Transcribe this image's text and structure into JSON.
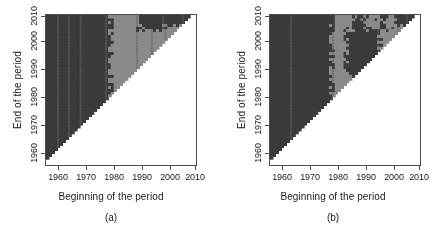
{
  "figure": {
    "width": 444,
    "height": 233,
    "background": "#ffffff",
    "colors": {
      "dark": "#3a3a3a",
      "light": "#8a8a8a",
      "empty": "#ffffff",
      "frame": "#4d4d4d",
      "text": "#1a1a1a"
    }
  },
  "panels": [
    {
      "key": "a",
      "sublabel": "(a)",
      "xlabel": "Beginning of the period",
      "ylabel": "End of the period",
      "xticks": [
        "1960",
        "1970",
        "1980",
        "1990",
        "2000",
        "2010"
      ],
      "yticks": [
        "1960",
        "1970",
        "1980",
        "1990",
        "2000",
        "2010"
      ]
    },
    {
      "key": "b",
      "sublabel": "(b)",
      "xlabel": "Beginning of the period",
      "ylabel": "End of the period",
      "xticks": [
        "1960",
        "1970",
        "1980",
        "1990",
        "2000",
        "2010"
      ],
      "yticks": [
        "1960",
        "1970",
        "1980",
        "1990",
        "2000",
        "2010"
      ]
    }
  ],
  "chart_data": [
    {
      "type": "heatmap",
      "panel": "a",
      "title": "",
      "xlabel": "Beginning of the period",
      "ylabel": "End of the period",
      "xlim": [
        1958,
        2011
      ],
      "ylim": [
        1958,
        2011
      ],
      "xticks": [
        1960,
        1970,
        1980,
        1990,
        2000,
        2010
      ],
      "yticks": [
        1960,
        1970,
        1980,
        1990,
        2000,
        2010
      ],
      "grid": false,
      "legend": "none",
      "categories_z": [
        "dark",
        "light",
        "empty"
      ],
      "z_colors": {
        "dark": "#3a3a3a",
        "light": "#8a8a8a",
        "empty": "#ffffff"
      },
      "note": "Lower-right triangle (end period < beginning period) is blank/white. Upper-left triangle is classified dark or light.",
      "regions": [
        {
          "z": "dark",
          "x_range": [
            1958,
            1981
          ],
          "y_range": [
            1958,
            2011
          ],
          "desc": "broad dark block for all beginning years before ~1981"
        },
        {
          "z": "light",
          "x_range": [
            1981,
            2008
          ],
          "y_range": [
            1983,
            2011
          ],
          "desc": "light wedge above diagonal for beginnings after ~1981"
        },
        {
          "z": "dark",
          "x_range": [
            1991,
            2000
          ],
          "y_range": [
            2006,
            2011
          ],
          "desc": "dark striped patch near top, beginnings 1991-2000"
        },
        {
          "z": "dark",
          "x_range": [
            2000,
            2008
          ],
          "y_range": [
            2007,
            2011
          ],
          "desc": "dark band along top-right edge"
        },
        {
          "z": "dark",
          "x_range": [
            1974,
            1976
          ],
          "y_range": [
            1995,
            2011
          ],
          "desc": "narrow dark vertical striping at ~1975"
        },
        {
          "z": "dark",
          "x_range": [
            1958,
            1965
          ],
          "y_range": [
            1962,
            1968
          ],
          "desc": "mottled dark/light speckle near bottom-left diagonal"
        }
      ]
    },
    {
      "type": "heatmap",
      "panel": "b",
      "title": "",
      "xlabel": "Beginning of the period",
      "ylabel": "End of the period",
      "xlim": [
        1958,
        2011
      ],
      "ylim": [
        1958,
        2011
      ],
      "xticks": [
        1960,
        1970,
        1980,
        1990,
        2000,
        2010
      ],
      "yticks": [
        1960,
        1970,
        1980,
        1990,
        2000,
        2010
      ],
      "grid": false,
      "legend": "none",
      "categories_z": [
        "dark",
        "light",
        "empty"
      ],
      "z_colors": {
        "dark": "#3a3a3a",
        "light": "#8a8a8a",
        "empty": "#ffffff"
      },
      "note": "Lower-right triangle is blank/white. Dark dominates with a light wedge after ~1980 interrupted by a dark intrusion between ~1985 and ~1997.",
      "regions": [
        {
          "z": "dark",
          "x_range": [
            1958,
            1980
          ],
          "y_range": [
            1958,
            2011
          ],
          "desc": "broad dark block for beginnings before ~1980"
        },
        {
          "z": "light",
          "x_range": [
            1980,
            2006
          ],
          "y_range": [
            1982,
            2011
          ],
          "desc": "light wedge above diagonal for beginnings after ~1980"
        },
        {
          "z": "dark",
          "x_range": [
            1985,
            1997
          ],
          "y_range": [
            1990,
            2006
          ],
          "desc": "large dark intrusion splitting the light wedge"
        },
        {
          "z": "dark",
          "x_range": [
            1988,
            1992
          ],
          "y_range": [
            2006,
            2010
          ],
          "desc": "small dark blotch near top"
        },
        {
          "z": "dark",
          "x_range": [
            1996,
            1999
          ],
          "y_range": [
            2006,
            2010
          ],
          "desc": "small dark blotch near top right"
        },
        {
          "z": "dark",
          "x_range": [
            2002,
            2006
          ],
          "y_range": [
            2007,
            2011
          ],
          "desc": "dark speck at top-right edge"
        },
        {
          "z": "dark",
          "x_range": [
            1958,
            1963
          ],
          "y_range": [
            1960,
            1972
          ],
          "desc": "dark along left-bottom diagonal edge"
        }
      ]
    }
  ]
}
